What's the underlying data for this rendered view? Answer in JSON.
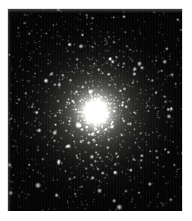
{
  "page": {
    "background_color": "#ffffff",
    "width": 192,
    "height": 221
  },
  "caption": {
    "text": "clipped text row — illegible",
    "color": "#9a9a9a",
    "visible_fragment": "",
    "note": "only the lower pixel row of a line of type is visible at the top edge"
  },
  "plate": {
    "name": "globular-cluster-photograph",
    "subject": "globular star cluster",
    "x": 8,
    "y": 9,
    "width": 174,
    "height": 202,
    "background_color": "#050505",
    "border_color": "#c8c8c8",
    "core": {
      "center_x": 88,
      "center_y": 103,
      "radius": 30,
      "color": "#f2f2ee"
    },
    "halo": {
      "radius": 78,
      "color": "#9a9a96"
    },
    "star_color_bright": "#ffffff",
    "star_color_mid": "#cfcfcb",
    "star_color_faint": "#6e6e6a",
    "star_count": 2600
  },
  "chart_data": {
    "type": "scatter",
    "title": "",
    "xlabel": "",
    "ylabel": "",
    "xlim": [
      0,
      174
    ],
    "ylim": [
      0,
      202
    ],
    "grid": false,
    "legend": null,
    "core_center": [
      88,
      103
    ],
    "core_radius_px": 30,
    "halo_radius_px": 78,
    "density_profile": {
      "radius_px": [
        0,
        12,
        24,
        36,
        48,
        60,
        75,
        90,
        110
      ],
      "relative_brightness": [
        1.0,
        0.92,
        0.72,
        0.5,
        0.34,
        0.22,
        0.12,
        0.06,
        0.03
      ]
    }
  }
}
